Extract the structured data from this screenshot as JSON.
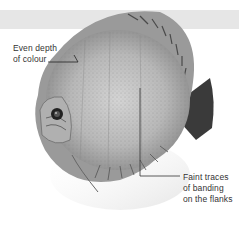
{
  "figure": {
    "background_band_color": "#e6e6e6",
    "annotations": [
      {
        "id": "depth",
        "lines": [
          "Even depth",
          "of colour"
        ]
      },
      {
        "id": "banding",
        "lines": [
          "Faint traces",
          "of banding",
          "on the flanks"
        ]
      }
    ]
  }
}
